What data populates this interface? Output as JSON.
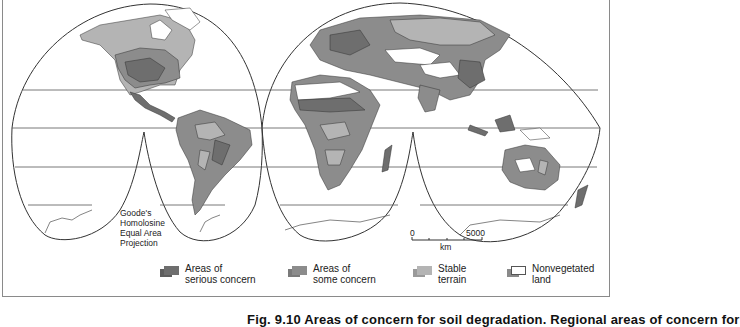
{
  "map": {
    "projection_label": [
      "Goode's",
      "Homolosine",
      "Equal Area",
      "Projection"
    ],
    "scale_bar": {
      "start": "0",
      "end": "5000",
      "unit": "km"
    },
    "colors": {
      "serious_concern": "#6e6e6e",
      "some_concern": "#8c8c8c",
      "stable_terrain": "#b4b4b4",
      "nonvegetated": "#ffffff",
      "outline": "#333333"
    }
  },
  "legend": {
    "items": [
      {
        "line1": "Areas of",
        "line2": "serious concern",
        "color": "#6e6e6e"
      },
      {
        "line1": "Areas of",
        "line2": "some concern",
        "color": "#8c8c8c"
      },
      {
        "line1": "Stable",
        "line2": "terrain",
        "color": "#b4b4b4"
      },
      {
        "line1": "Nonvegetated",
        "line2": "land",
        "color": "#ffffff"
      }
    ]
  },
  "caption": "Fig. 9.10 Areas of concern for soil degradation. Regional areas of concern for"
}
